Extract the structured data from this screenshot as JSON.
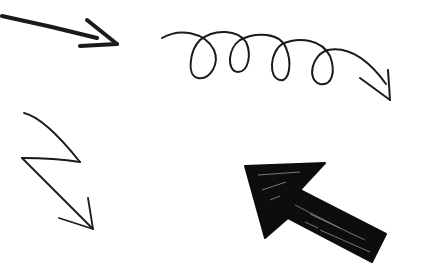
{
  "canvas": {
    "width": 427,
    "height": 279,
    "background": "#ffffff"
  },
  "colors": {
    "ink": "#1a1a1a",
    "fill": "#0d0d0d"
  },
  "arrows": [
    {
      "name": "straight-arrow",
      "direction": "right-slightly-down",
      "style": "thick stroke"
    },
    {
      "name": "loopy-arrow",
      "direction": "right",
      "loops": 4,
      "style": "thin stroke"
    },
    {
      "name": "zigzag-arrow",
      "direction": "down-right",
      "style": "thin stroke"
    },
    {
      "name": "filled-arrow",
      "direction": "up-left",
      "style": "scribble-filled"
    }
  ]
}
